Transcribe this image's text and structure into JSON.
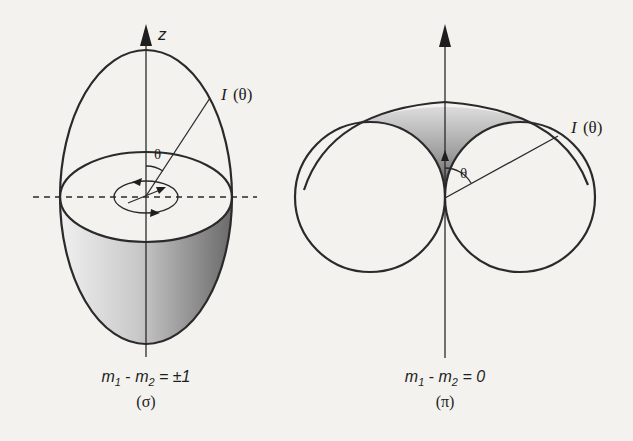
{
  "figure": {
    "background": "#f3f2ef",
    "stroke_color": "#2a2a2a",
    "shade_light": "#e4e4e4",
    "shade_dark": "#6e6e6e"
  },
  "panel_sigma": {
    "axis_label": "z",
    "intensity_label_main": "I",
    "intensity_label_arg": "(θ)",
    "angle_label": "θ",
    "caption": {
      "m1": "m",
      "m1_sub": "1",
      "minus": " - ",
      "m2": "m",
      "m2_sub": "2",
      "rhs": " = ±1"
    },
    "transition_label": "(σ)"
  },
  "panel_pi": {
    "intensity_label_main": "I",
    "intensity_label_arg": "(θ)",
    "angle_label": "θ",
    "caption": {
      "m1": "m",
      "m1_sub": "1",
      "minus": " - ",
      "m2": "m",
      "m2_sub": "2",
      "rhs": " = 0"
    },
    "transition_label": "(π)"
  }
}
